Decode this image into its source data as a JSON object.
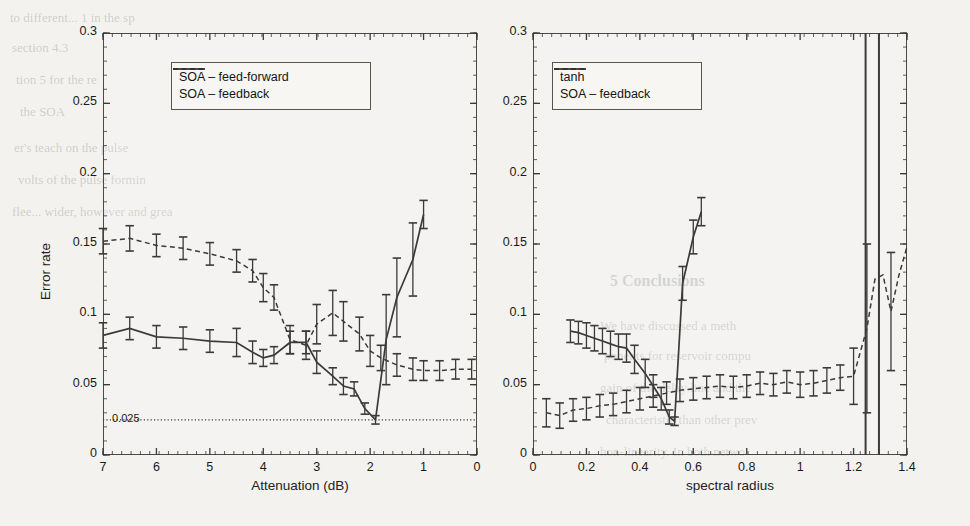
{
  "figure": {
    "background_color": "#f3f2ef",
    "ink_color": "#3a3a38",
    "page_bleed_text": [
      "to different... 1 in the sp",
      "section 4.3",
      "tion 5 for the re",
      "the SOA",
      "er's teach on the pulse",
      "volts of the pulse formin",
      "flee... wider, however and grea",
      "5   Conclusions",
      "We have discussed a meth",
      "ponents for reservoir compu",
      "gain of the delay line and the",
      "characteristic than other prev",
      "hon-linearity. In both netwo"
    ]
  },
  "left_plot": {
    "name": "attenuation-panel",
    "xlabel": "Attenuation (dB)",
    "ylabel": "Error rate",
    "xticks": [
      "7",
      "6",
      "5",
      "4",
      "3",
      "2",
      "1",
      "0"
    ],
    "xtick_values": [
      7,
      6,
      5,
      4,
      3,
      2,
      1,
      0
    ],
    "yticks": [
      "0",
      "0.05",
      "0.1",
      "0.15",
      "0.2",
      "0.25",
      "0.3"
    ],
    "ytick_values": [
      0,
      0.05,
      0.1,
      0.15,
      0.2,
      0.25,
      0.3
    ],
    "reference_line_label": "0.025",
    "reference_line_value": 0.025,
    "legend": [
      {
        "label": "SOA – feed-forward",
        "style": "dashed"
      },
      {
        "label": "SOA – feedback",
        "style": "solid"
      }
    ]
  },
  "right_plot": {
    "name": "spectral-radius-panel",
    "xlabel": "spectral radius",
    "ylabel": "",
    "xticks": [
      "0",
      "0.2",
      "0.4",
      "0.6",
      "0.8",
      "1",
      "1.2",
      "1.4"
    ],
    "xtick_values": [
      0,
      0.2,
      0.4,
      0.6,
      0.8,
      1.0,
      1.2,
      1.4
    ],
    "yticks": [
      "0",
      "0.05",
      "0.1",
      "0.15",
      "0.2",
      "0.25",
      "0.3"
    ],
    "ytick_values": [
      0,
      0.05,
      0.1,
      0.15,
      0.2,
      0.25,
      0.3
    ],
    "legend": [
      {
        "label": "tanh",
        "style": "dashed"
      },
      {
        "label": "SOA – feedback",
        "style": "solid"
      }
    ]
  },
  "chart_data": [
    {
      "type": "line",
      "name": "attenuation-panel",
      "title": "",
      "xlabel": "Attenuation (dB)",
      "ylabel": "Error rate",
      "xlim": [
        7,
        0
      ],
      "ylim": [
        0,
        0.3
      ],
      "x_reversed": true,
      "grid": false,
      "legend_position": "top-center",
      "annotations": [
        {
          "text": "0.025",
          "x": 6.55,
          "y": 0.0335,
          "kind": "reference-line-label"
        }
      ],
      "reference_lines": [
        {
          "y": 0.025,
          "style": "dotted",
          "label": "0.025"
        }
      ],
      "series": [
        {
          "name": "SOA – feed-forward",
          "style": "dashed",
          "x": [
            7.0,
            6.5,
            6.0,
            5.5,
            5.0,
            4.5,
            4.2,
            4.0,
            3.8,
            3.5,
            3.2,
            3.0,
            2.7,
            2.5,
            2.2,
            2.0,
            1.8,
            1.5,
            1.2,
            1.0,
            0.7,
            0.4,
            0.1
          ],
          "values": [
            0.152,
            0.154,
            0.149,
            0.147,
            0.143,
            0.138,
            0.131,
            0.119,
            0.112,
            0.082,
            0.078,
            0.093,
            0.101,
            0.095,
            0.086,
            0.074,
            0.069,
            0.064,
            0.061,
            0.06,
            0.06,
            0.061,
            0.061
          ],
          "errors": [
            0.009,
            0.009,
            0.008,
            0.008,
            0.008,
            0.008,
            0.008,
            0.01,
            0.009,
            0.01,
            0.01,
            0.014,
            0.016,
            0.014,
            0.012,
            0.011,
            0.009,
            0.008,
            0.008,
            0.007,
            0.007,
            0.007,
            0.007
          ]
        },
        {
          "name": "SOA – feedback",
          "style": "solid",
          "x": [
            7.0,
            6.5,
            6.0,
            5.5,
            5.0,
            4.5,
            4.2,
            4.0,
            3.8,
            3.5,
            3.2,
            3.0,
            2.7,
            2.5,
            2.3,
            2.1,
            1.9,
            1.7,
            1.5,
            1.2,
            1.0
          ],
          "values": [
            0.085,
            0.09,
            0.084,
            0.083,
            0.081,
            0.08,
            0.073,
            0.069,
            0.071,
            0.08,
            0.08,
            0.066,
            0.056,
            0.049,
            0.047,
            0.033,
            0.025,
            0.082,
            0.112,
            0.139,
            0.171
          ],
          "errors": [
            0.009,
            0.008,
            0.008,
            0.008,
            0.008,
            0.01,
            0.008,
            0.006,
            0.006,
            0.008,
            0.008,
            0.008,
            0.006,
            0.006,
            0.005,
            0.004,
            0.003,
            0.032,
            0.028,
            0.026,
            0.01
          ]
        }
      ]
    },
    {
      "type": "line",
      "name": "spectral-radius-panel",
      "title": "",
      "xlabel": "spectral radius",
      "ylabel": "",
      "xlim": [
        0,
        1.4
      ],
      "ylim": [
        0,
        0.3
      ],
      "x_reversed": false,
      "grid": false,
      "legend_position": "top-left",
      "annotations": [],
      "reference_lines": [],
      "series": [
        {
          "name": "tanh",
          "style": "dashed",
          "x": [
            0.05,
            0.1,
            0.15,
            0.2,
            0.25,
            0.3,
            0.35,
            0.4,
            0.45,
            0.5,
            0.55,
            0.6,
            0.65,
            0.7,
            0.75,
            0.8,
            0.85,
            0.9,
            0.95,
            1.0,
            1.05,
            1.1,
            1.15,
            1.2,
            1.25,
            1.28,
            1.31,
            1.34,
            1.37,
            1.4
          ],
          "values": [
            0.03,
            0.028,
            0.032,
            0.033,
            0.035,
            0.036,
            0.038,
            0.04,
            0.042,
            0.044,
            0.046,
            0.047,
            0.048,
            0.049,
            0.048,
            0.049,
            0.051,
            0.05,
            0.052,
            0.05,
            0.051,
            0.053,
            0.055,
            0.056,
            0.09,
            0.125,
            0.128,
            0.102,
            0.128,
            0.148
          ],
          "errors": [
            0.01,
            0.009,
            0.008,
            0.008,
            0.008,
            0.008,
            0.008,
            0.008,
            0.008,
            0.008,
            0.008,
            0.008,
            0.008,
            0.008,
            0.008,
            0.008,
            0.008,
            0.008,
            0.008,
            0.009,
            0.009,
            0.009,
            0.009,
            0.02,
            0.06,
            0.0,
            0.0,
            0.042,
            0.0,
            0.0
          ]
        },
        {
          "name": "SOA – feedback",
          "style": "solid",
          "x": [
            0.14,
            0.17,
            0.2,
            0.23,
            0.26,
            0.29,
            0.32,
            0.35,
            0.38,
            0.42,
            0.45,
            0.48,
            0.51,
            0.53,
            0.56,
            0.6,
            0.63
          ],
          "values": [
            0.088,
            0.087,
            0.085,
            0.083,
            0.081,
            0.079,
            0.077,
            0.076,
            0.068,
            0.058,
            0.049,
            0.04,
            0.027,
            0.024,
            0.122,
            0.155,
            0.173
          ],
          "errors": [
            0.008,
            0.008,
            0.009,
            0.009,
            0.009,
            0.009,
            0.009,
            0.01,
            0.01,
            0.01,
            0.008,
            0.008,
            0.005,
            0.003,
            0.012,
            0.012,
            0.01
          ]
        },
        {
          "name": "off-scale-spike-1",
          "style": "solid-vertical",
          "x": [
            1.245
          ],
          "values": [
            0.3
          ],
          "errors": [
            0.3
          ]
        },
        {
          "name": "off-scale-spike-2",
          "style": "solid-vertical",
          "x": [
            1.295
          ],
          "values": [
            0.3
          ],
          "errors": [
            0.3
          ]
        }
      ]
    }
  ]
}
